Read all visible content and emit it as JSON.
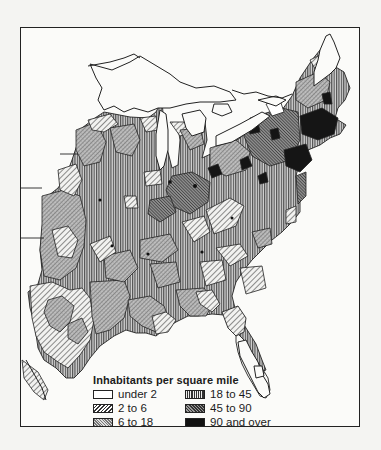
{
  "map": {
    "subject": "Population density, eastern United States",
    "legend": {
      "title": "Inhabitants per square mile",
      "items": [
        {
          "label": "under 2",
          "pattern": "blank"
        },
        {
          "label": "2 to 6",
          "pattern": "wide-diagonal-hatch"
        },
        {
          "label": "6 to 18",
          "pattern": "fine-crosshatch"
        },
        {
          "label": "18 to 45",
          "pattern": "vertical-lines"
        },
        {
          "label": "45 to 90",
          "pattern": "dense-diagonal-hatch"
        },
        {
          "label": "90 and over",
          "pattern": "solid-black"
        }
      ]
    },
    "colors": {
      "ink": "#1c1c1c",
      "paper": "#fbfbf9",
      "water": "#ffffff"
    }
  }
}
